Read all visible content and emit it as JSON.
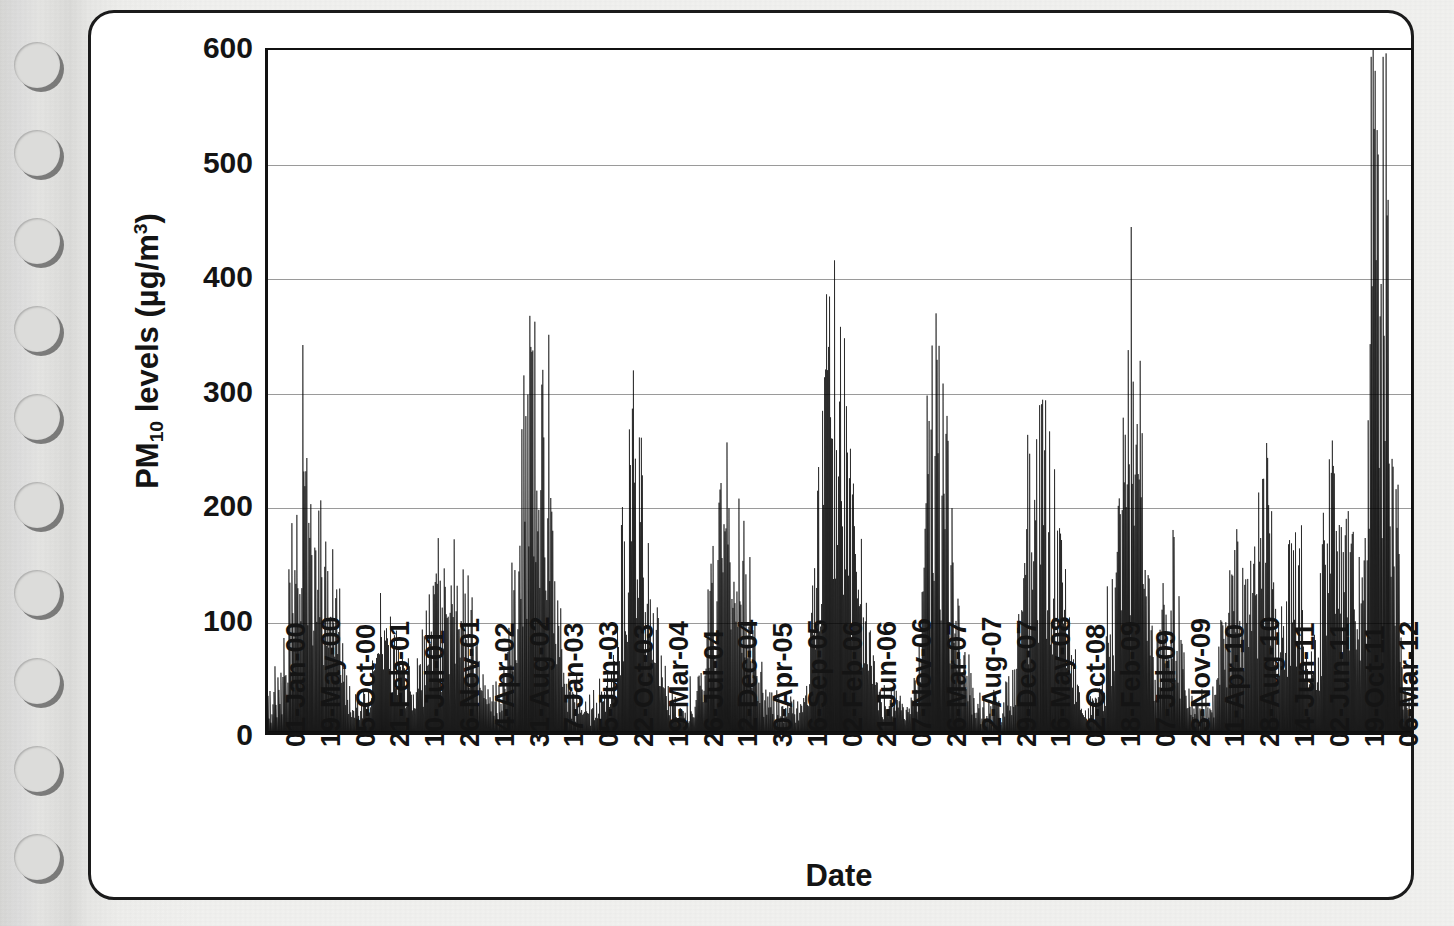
{
  "page": {
    "medium": "scanned-spiral-bound-page",
    "binding_hole_count": 10
  },
  "figure": {
    "axis_title_y": "PM",
    "axis_title_y_sub": "10",
    "axis_title_y_rest": " levels (µg/m",
    "axis_title_y_sup": "3",
    "axis_title_y_end": ")",
    "axis_title_x": "Date"
  },
  "chart_data": {
    "type": "bar",
    "title": "",
    "subtitle": "",
    "xlabel": "Date",
    "ylabel": "PM10 levels (µg/m3)",
    "ylim": [
      0,
      600
    ],
    "yticks": [
      0,
      100,
      200,
      300,
      400,
      500,
      600
    ],
    "ytick_labels": [
      "0",
      "100",
      "200",
      "300",
      "400",
      "500",
      "600"
    ],
    "grid": true,
    "grid_axis": "y",
    "legend": false,
    "legend_position": "none",
    "series_color": "#000000",
    "bar_style": "dense-daily-spikes",
    "xtick_labels": [
      "01-Jan-00",
      "19-May-00",
      "05-Oct-00",
      "21-Feb-01",
      "10-Jul-01",
      "26-Nov-01",
      "14-Apr-02",
      "31-Aug-02",
      "17-Jan-03",
      "05-Jun-03",
      "22-Oct-03",
      "19-Mar-04",
      "26-Jul-04",
      "12-Dec-04",
      "30-Apr-05",
      "16-Sep-05",
      "02-Feb-06",
      "21-Jun-06",
      "07-Nov-06",
      "26-Mar-07",
      "12-Aug-07",
      "29-Dec-07",
      "16-May-08",
      "02-Oct-08",
      "18-Feb-09",
      "07-Jul-09",
      "23-Nov-09",
      "11-Apr-10",
      "28-Aug-10",
      "14-Jun-11",
      "02-Jun-11",
      "19-Oct-11",
      "06-Mar-12"
    ],
    "x_range_start": "01-Jan-00",
    "x_range_end": "06-Mar-12",
    "observation_note": "Daily PM10 concentrations showing strong recurring winter/seasonal peaks.",
    "annual_peak_maxima": [
      {
        "season": "2000 winter",
        "value": 207
      },
      {
        "season": "2000-01 winter",
        "value": 72
      },
      {
        "season": "2001 winter",
        "value": 95
      },
      {
        "season": "2002 winter",
        "value": 270
      },
      {
        "season": "2003 winter",
        "value": 216
      },
      {
        "season": "2004 winter",
        "value": 174
      },
      {
        "season": "2005 winter",
        "value": 307
      },
      {
        "season": "2006 winter",
        "value": 253
      },
      {
        "season": "2007 winter",
        "value": 203
      },
      {
        "season": "2008 winter",
        "value": 210
      },
      {
        "season": "2009 winter",
        "value": 180
      },
      {
        "season": "2010 winter",
        "value": 133
      },
      {
        "season": "2011 mid",
        "value": 224
      },
      {
        "season": "2011 winter",
        "value": 508
      },
      {
        "season": "2011 winter second",
        "value": 411
      }
    ],
    "global_max": 508,
    "global_max_label": "19-Oct-11",
    "baseline_typical": 30
  }
}
